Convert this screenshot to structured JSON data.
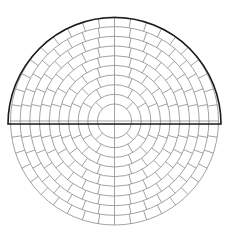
{
  "diagram": {
    "title": "",
    "type": "polar-grid",
    "canvas": {
      "width": 227,
      "height": 232,
      "background": "#ffffff"
    },
    "grid": {
      "center": [
        114.5,
        121
      ],
      "inner_radius": 17,
      "ring_count": 9,
      "outer_radius": 104,
      "spokes_per_ring": [
        4,
        8,
        12,
        16,
        20,
        24,
        28,
        32,
        36,
        40
      ],
      "stroke": "#8a8a8a",
      "stroke_width": 0.8
    },
    "semicircle_outline": {
      "center": [
        114.5,
        124
      ],
      "radius": 106.5,
      "side": "top",
      "stroke": "#1a1a1a",
      "stroke_width": 1.6
    }
  }
}
